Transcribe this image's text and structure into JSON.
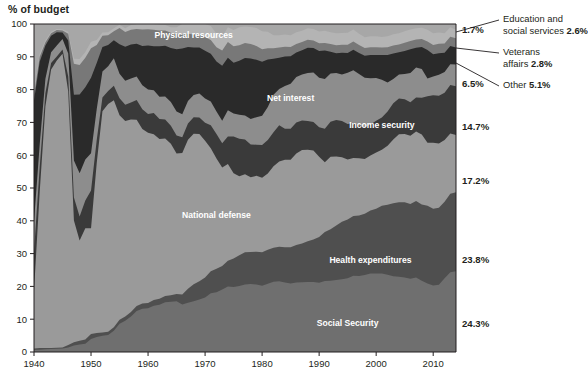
{
  "axis_title": "% of budget",
  "chart_data": {
    "type": "area",
    "stacked": true,
    "title": "",
    "subtitle": "",
    "xlabel": "",
    "ylabel": "% of budget",
    "xlim": [
      1940,
      2014
    ],
    "ylim": [
      0,
      100
    ],
    "grid": false,
    "legend_position": "in-plot labels + right callouts",
    "x_ticks": [
      1940,
      1950,
      1960,
      1970,
      1980,
      1990,
      2000,
      2010
    ],
    "y_ticks": [
      0,
      10,
      20,
      30,
      40,
      50,
      60,
      70,
      80,
      90,
      100
    ],
    "x": [
      1940,
      1941,
      1942,
      1943,
      1944,
      1945,
      1946,
      1947,
      1948,
      1949,
      1950,
      1951,
      1952,
      1953,
      1954,
      1955,
      1956,
      1957,
      1958,
      1959,
      1960,
      1961,
      1962,
      1963,
      1964,
      1965,
      1966,
      1967,
      1968,
      1969,
      1970,
      1971,
      1972,
      1973,
      1974,
      1975,
      1976,
      1977,
      1978,
      1979,
      1980,
      1981,
      1982,
      1983,
      1984,
      1985,
      1986,
      1987,
      1988,
      1989,
      1990,
      1991,
      1992,
      1993,
      1994,
      1995,
      1996,
      1997,
      1998,
      1999,
      2000,
      2001,
      2002,
      2003,
      2004,
      2005,
      2006,
      2007,
      2008,
      2009,
      2010,
      2011,
      2012,
      2013,
      2014
    ],
    "series": [
      {
        "name": "Social Security",
        "key": "social_security",
        "color": "#6f6f6f",
        "final_pct": "24.3%",
        "in_plot_label": "Social Security",
        "values": [
          0.6,
          0.7,
          0.8,
          0.9,
          1.0,
          1.1,
          1.4,
          2.0,
          2.3,
          2.5,
          4.0,
          4.6,
          5.0,
          5.2,
          6.5,
          8.6,
          9.6,
          10.9,
          12.5,
          13.2,
          13.4,
          14.2,
          14.5,
          15.2,
          15.3,
          15.5,
          14.5,
          15.0,
          15.5,
          16.0,
          16.6,
          17.9,
          18.6,
          19.8,
          20.0,
          19.8,
          20.1,
          20.6,
          20.7,
          20.6,
          20.2,
          20.8,
          21.4,
          21.6,
          21.2,
          20.9,
          21.0,
          21.0,
          20.9,
          20.9,
          20.6,
          21.0,
          21.3,
          21.6,
          21.7,
          22.0,
          22.3,
          22.5,
          22.8,
          23.0,
          23.0,
          23.0,
          22.6,
          22.2,
          22.0,
          21.8,
          21.2,
          21.6,
          21.1,
          20.5,
          20.3,
          20.5,
          22.3,
          23.8,
          24.3
        ]
      },
      {
        "name": "Health expenditures",
        "key": "health_expenditures",
        "color": "#4f4f4f",
        "final_pct": "23.8%",
        "in_plot_label": "Health expenditures",
        "values": [
          0.5,
          0.5,
          0.4,
          0.3,
          0.3,
          0.3,
          0.7,
          1.0,
          1.1,
          1.3,
          1.5,
          1.2,
          1.0,
          1.0,
          1.1,
          1.2,
          1.3,
          1.4,
          1.5,
          1.6,
          1.6,
          1.7,
          1.8,
          1.9,
          2.0,
          2.2,
          3.0,
          4.3,
          5.2,
          5.6,
          6.1,
          6.7,
          7.3,
          7.5,
          7.8,
          8.7,
          9.4,
          9.8,
          9.8,
          10.0,
          10.2,
          10.4,
          10.4,
          10.5,
          10.7,
          11.0,
          11.3,
          11.6,
          12.1,
          12.7,
          13.6,
          14.5,
          15.4,
          16.3,
          17.2,
          17.6,
          17.5,
          17.9,
          18.1,
          18.4,
          18.9,
          19.8,
          20.5,
          21.3,
          21.8,
          22.0,
          21.7,
          22.1,
          22.5,
          23.2,
          23.4,
          23.5,
          23.2,
          23.5,
          23.8
        ]
      },
      {
        "name": "National defense",
        "key": "national_defense",
        "color": "#9a9a9a",
        "final_pct": "17.2%",
        "in_plot_label": "National defense",
        "values": [
          17.5,
          47.1,
          73.0,
          84.9,
          86.7,
          89.5,
          77.3,
          37.1,
          30.6,
          33.9,
          32.2,
          51.8,
          68.1,
          69.4,
          69.5,
          62.4,
          60.2,
          59.3,
          56.8,
          53.2,
          52.2,
          50.8,
          49.0,
          48.0,
          46.2,
          42.8,
          43.2,
          45.4,
          46.0,
          44.9,
          41.8,
          37.5,
          34.3,
          31.2,
          29.5,
          26.0,
          24.1,
          23.8,
          22.8,
          23.1,
          22.7,
          23.2,
          24.8,
          26.0,
          26.7,
          26.7,
          27.6,
          28.1,
          27.3,
          26.6,
          23.9,
          20.6,
          21.6,
          20.7,
          19.3,
          17.9,
          17.0,
          16.9,
          16.2,
          16.1,
          16.5,
          16.4,
          17.3,
          18.7,
          19.9,
          20.0,
          19.7,
          20.2,
          20.7,
          18.8,
          20.1,
          19.6,
          18.7,
          18.0,
          17.2
        ]
      },
      {
        "name": "Income security",
        "key": "income_security",
        "color": "#3a3a3a",
        "final_pct": "14.7%",
        "in_plot_label": "Income security",
        "values": [
          12.0,
          7.5,
          4.0,
          2.0,
          1.2,
          1.3,
          4.6,
          7.0,
          7.3,
          8.5,
          11.5,
          7.0,
          4.3,
          4.0,
          4.5,
          5.2,
          5.0,
          5.2,
          6.0,
          6.0,
          5.7,
          6.5,
          6.1,
          5.8,
          5.5,
          5.5,
          4.8,
          5.0,
          5.0,
          5.0,
          5.5,
          7.0,
          7.6,
          7.7,
          8.4,
          11.2,
          11.4,
          10.6,
          10.0,
          9.5,
          10.0,
          10.2,
          10.4,
          11.0,
          9.5,
          9.5,
          9.4,
          8.9,
          8.6,
          8.5,
          8.8,
          9.9,
          10.5,
          10.9,
          10.8,
          10.6,
          10.2,
          9.7,
          9.4,
          9.1,
          9.3,
          9.4,
          10.0,
          10.6,
          10.5,
          10.2,
          9.7,
          9.8,
          10.9,
          13.9,
          14.5,
          14.5,
          14.3,
          14.5,
          14.7
        ]
      },
      {
        "name": "Net interest",
        "key": "net_interest",
        "color": "#8d8d8d",
        "final_pct": "6.5%",
        "in_plot_label": "Net interest",
        "values": [
          9.1,
          6.8,
          4.3,
          3.3,
          3.3,
          3.2,
          7.0,
          11.3,
          13.2,
          12.5,
          11.4,
          9.5,
          8.0,
          7.5,
          8.4,
          7.4,
          7.4,
          7.4,
          7.2,
          7.3,
          7.5,
          7.0,
          6.8,
          7.0,
          7.2,
          7.3,
          7.0,
          6.8,
          6.8,
          7.3,
          7.4,
          7.3,
          7.0,
          7.1,
          8.0,
          7.0,
          7.3,
          7.3,
          7.7,
          8.4,
          8.9,
          10.1,
          11.4,
          11.1,
          13.0,
          13.7,
          13.7,
          13.8,
          14.3,
          14.8,
          14.7,
          14.7,
          14.4,
          14.1,
          13.9,
          15.3,
          15.5,
          15.2,
          14.6,
          13.5,
          12.5,
          11.1,
          8.5,
          7.1,
          7.0,
          7.4,
          8.5,
          8.7,
          8.5,
          5.3,
          5.7,
          6.4,
          6.3,
          6.2,
          6.5
        ]
      },
      {
        "name": "Other",
        "key": "other",
        "color": "#2a2a2a",
        "final_pct": "5.1%",
        "callout": true,
        "values": [
          37.0,
          25.0,
          10.0,
          5.0,
          4.0,
          2.0,
          4.0,
          20.0,
          24.0,
          22.0,
          23.0,
          14.0,
          7.5,
          6.5,
          5.5,
          9.0,
          10.5,
          10.5,
          10.0,
          12.0,
          13.5,
          13.5,
          15.5,
          15.5,
          16.5,
          19.0,
          20.0,
          16.5,
          14.5,
          14.0,
          14.5,
          14.5,
          15.5,
          17.5,
          16.0,
          15.5,
          16.5,
          17.5,
          18.5,
          17.5,
          16.5,
          14.5,
          11.0,
          9.5,
          9.0,
          8.4,
          7.4,
          7.3,
          7.5,
          7.3,
          8.0,
          8.5,
          6.5,
          5.9,
          6.5,
          5.9,
          6.0,
          6.2,
          6.5,
          6.8,
          6.7,
          7.2,
          8.0,
          7.5,
          6.5,
          6.7,
          6.9,
          5.7,
          6.5,
          8.5,
          6.8,
          6.6,
          5.8,
          5.4,
          5.1
        ]
      },
      {
        "name": "Veterans affairs",
        "key": "veterans_affairs",
        "color": "#787878",
        "final_pct": "2.8%",
        "callout": true,
        "values": [
          1.8,
          1.5,
          1.0,
          0.8,
          0.7,
          0.6,
          2.0,
          9.5,
          9.0,
          9.0,
          9.0,
          5.5,
          3.5,
          3.0,
          2.8,
          5.0,
          4.5,
          4.5,
          4.5,
          5.0,
          5.0,
          5.0,
          4.8,
          4.6,
          4.6,
          4.6,
          4.3,
          4.0,
          4.0,
          4.0,
          4.2,
          4.2,
          4.5,
          4.8,
          4.8,
          5.0,
          4.7,
          4.6,
          4.4,
          4.2,
          3.8,
          3.4,
          3.2,
          3.1,
          3.0,
          2.8,
          2.6,
          2.5,
          2.4,
          2.3,
          2.3,
          2.2,
          2.3,
          2.4,
          2.4,
          2.5,
          2.4,
          2.4,
          2.3,
          2.3,
          2.3,
          2.2,
          2.3,
          2.3,
          2.3,
          2.4,
          2.4,
          2.4,
          2.4,
          2.6,
          2.8,
          2.9,
          2.8,
          2.8,
          2.8
        ]
      },
      {
        "name": "Education and social services",
        "key": "education_social_services",
        "color": "#b4b4b4",
        "final_pct": "2.6%",
        "callout": true,
        "values": [
          1.0,
          0.9,
          0.5,
          0.4,
          0.3,
          0.3,
          0.6,
          1.5,
          1.8,
          1.8,
          2.0,
          1.5,
          1.0,
          0.9,
          0.9,
          1.0,
          1.2,
          1.5,
          1.5,
          1.7,
          1.6,
          1.8,
          1.8,
          1.7,
          1.7,
          2.1,
          3.2,
          3.0,
          3.2,
          3.2,
          4.0,
          4.3,
          4.2,
          4.2,
          4.5,
          5.0,
          5.5,
          5.0,
          5.2,
          5.5,
          5.5,
          5.0,
          4.0,
          3.8,
          3.7,
          3.6,
          3.5,
          3.4,
          3.4,
          3.4,
          3.5,
          3.6,
          3.5,
          3.6,
          3.5,
          3.6,
          3.5,
          3.3,
          3.2,
          3.2,
          3.2,
          3.1,
          3.2,
          3.3,
          3.3,
          3.4,
          3.3,
          3.3,
          3.3,
          3.5,
          3.6,
          3.4,
          3.1,
          2.8,
          2.6
        ]
      },
      {
        "name": "Physical resources",
        "key": "physical_resources",
        "color": "#a7a7a7",
        "final_pct": "1.7%",
        "in_plot_label": "Physical resources",
        "callout": true,
        "values": [
          20.5,
          9.0,
          5.0,
          2.4,
          1.5,
          1.7,
          2.4,
          10.6,
          10.7,
          8.5,
          5.4,
          4.9,
          2.6,
          2.5,
          1.3,
          0.2,
          1.3,
          0.3,
          0.0,
          0.0,
          0.0,
          0.0,
          0.2,
          0.3,
          1.0,
          1.0,
          0.0,
          0.0,
          0.0,
          0.0,
          0.0,
          0.6,
          3.0,
          4.2,
          1.0,
          1.8,
          1.0,
          0.8,
          0.9,
          1.2,
          2.2,
          2.4,
          3.4,
          3.4,
          3.2,
          3.4,
          2.5,
          2.0,
          1.3,
          1.5,
          2.2,
          2.0,
          2.5,
          2.8,
          2.7,
          2.6,
          1.6,
          2.9,
          3.9,
          3.6,
          3.6,
          3.8,
          3.6,
          3.0,
          2.7,
          2.1,
          1.6,
          1.2,
          1.1,
          1.7,
          2.8,
          2.6,
          2.8,
          1.0,
          1.7
        ]
      }
    ],
    "right_percent_labels": [
      {
        "text": "1.7%",
        "series": "Physical resources"
      },
      {
        "text": "6.5%",
        "series": "Net interest"
      },
      {
        "text": "14.7%",
        "series": "Income security"
      },
      {
        "text": "17.2%",
        "series": "National defense"
      },
      {
        "text": "23.8%",
        "series": "Health expenditures"
      },
      {
        "text": "24.3%",
        "series": "Social Security"
      }
    ],
    "callouts": [
      {
        "line1": "Education and",
        "line2": "social services",
        "value": "2.6%"
      },
      {
        "line1": "Veterans",
        "line2": "affairs",
        "value": "2.8%"
      },
      {
        "line1": "Other",
        "line2": "",
        "value": "5.1%"
      }
    ]
  }
}
